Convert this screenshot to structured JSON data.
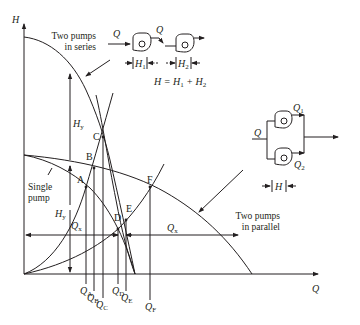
{
  "axes": {
    "y_label": "H",
    "x_label": "Q"
  },
  "annotations": {
    "series_label_line1": "Two pumps",
    "series_label_line2": "in series",
    "parallel_label_line1": "Two pumps",
    "parallel_label_line2": "in parallel",
    "single_label_line1": "Single",
    "single_label_line2": "pump",
    "hy_upper": "H",
    "hy_upper_sub": "y",
    "hy_lower": "H",
    "hy_lower_sub": "y",
    "qx_left": "Q",
    "qx_left_sub": "x",
    "qx_right": "Q",
    "qx_right_sub": "x"
  },
  "points": {
    "A": "A",
    "B": "B",
    "C": "C",
    "D": "D",
    "E": "E",
    "F": "F"
  },
  "q_ticks": [
    {
      "base": "Q",
      "sub": "A"
    },
    {
      "base": "Q",
      "sub": "B"
    },
    {
      "base": "Q",
      "sub": "C"
    },
    {
      "base": "Q",
      "sub": "D"
    },
    {
      "base": "Q",
      "sub": "E"
    },
    {
      "base": "Q",
      "sub": "F"
    }
  ],
  "series_schematic": {
    "flow_in": "Q",
    "flow_mid": "Q",
    "h1": "H",
    "h1_sub": "1",
    "h2": "H",
    "h2_sub": "2",
    "equation": "H = H",
    "equation_sub1": "1",
    "equation_plus": " + H",
    "equation_sub2": "2"
  },
  "parallel_schematic": {
    "flow_in": "Q",
    "q1": "Q",
    "q1_sub": "1",
    "q2": "Q",
    "q2_sub": "2",
    "h": "H"
  },
  "colors": {
    "line": "#231f20",
    "background": "#ffffff"
  }
}
